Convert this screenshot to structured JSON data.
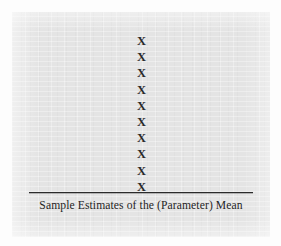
{
  "figure": {
    "background_color": "#fdfdfd",
    "panel_color": "#e4e4e4",
    "ink_color": "#2a2a2a",
    "axis_caption": "Sample Estimates of the (Parameter) Mean",
    "mark_glyph": "X"
  },
  "chart_data": {
    "type": "scatter",
    "title": "",
    "subtitle": "",
    "xlabel": "Sample Estimates of the (Parameter) Mean",
    "ylabel": "",
    "grid": false,
    "legend": false,
    "axis_ticks": [],
    "marker": "X",
    "categories": [
      "X",
      "X",
      "X",
      "X",
      "X",
      "X",
      "X",
      "X",
      "X",
      "X"
    ],
    "x": [
      0,
      0,
      0,
      0,
      0,
      0,
      0,
      0,
      0,
      0
    ],
    "values": [
      1,
      2,
      3,
      4,
      5,
      6,
      7,
      8,
      9,
      10
    ],
    "count": 10,
    "series": [
      {
        "name": "Sample estimates",
        "values": [
          1,
          2,
          3,
          4,
          5,
          6,
          7,
          8,
          9,
          10
        ]
      }
    ]
  }
}
